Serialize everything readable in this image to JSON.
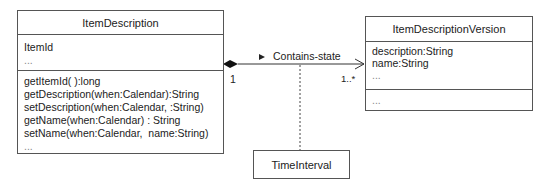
{
  "classes": {
    "item_description": {
      "name": "ItemDescription",
      "attributes": [
        "ItemId",
        "..."
      ],
      "methods": [
        "getItemId( ):long",
        "getDescription(when:Calendar):String",
        "setDescription(when:Calendar, :String)",
        "getName(when:Calendar) : String",
        "setName(when:Calendar,  name:String)",
        "..."
      ]
    },
    "item_description_version": {
      "name": "ItemDescriptionVersion",
      "attributes": [
        "description:String",
        "name:String",
        "..."
      ],
      "methods": [
        "..."
      ]
    },
    "time_interval": {
      "name": "TimeInterval"
    }
  },
  "association": {
    "name": "Contains-state",
    "direction_marker": "▶",
    "source_multiplicity": "1",
    "target_multiplicity": "1..*",
    "source_end": "composition-diamond",
    "target_end": "open-arrow"
  }
}
